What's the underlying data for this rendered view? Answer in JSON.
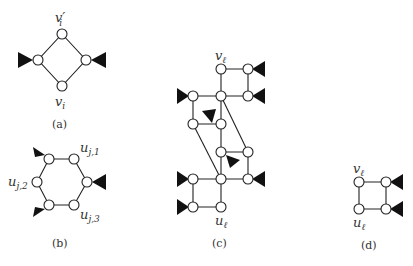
{
  "panels": {
    "a": {
      "caption": "(a)",
      "labels": {
        "top": "v",
        "top_prime": "′",
        "top_sub": "i",
        "bottom": "v",
        "bottom_sub": "i"
      }
    },
    "b": {
      "caption": "(b)",
      "labels": {
        "u1": "u",
        "u1_sub": "j,1",
        "u2": "u",
        "u2_sub": "j,2",
        "u3": "u",
        "u3_sub": "j,3"
      }
    },
    "c": {
      "caption": "(c)",
      "labels": {
        "top": "v",
        "top_sub": "ℓ",
        "bottom": "u",
        "bottom_sub": "ℓ"
      }
    },
    "d": {
      "caption": "(d)",
      "labels": {
        "top": "v",
        "top_sub": "ℓ",
        "bottom": "u",
        "bottom_sub": "ℓ"
      }
    }
  },
  "icons": {
    "node": "open-circle",
    "port": "filled-triangle"
  }
}
